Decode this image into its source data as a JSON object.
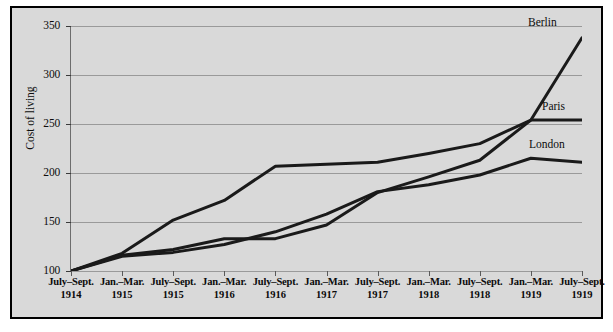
{
  "chart_data": {
    "type": "line",
    "title": "",
    "subtitle": "",
    "xlabel": "",
    "ylabel": "Cost of living",
    "ylim": [
      100,
      350
    ],
    "yticks": [
      100,
      150,
      200,
      250,
      300,
      350
    ],
    "grid": true,
    "legend_position": "inline-right-end-labels",
    "categories": [
      {
        "period": "July–Sept.",
        "year": "1914"
      },
      {
        "period": "Jan.–Mar.",
        "year": "1915"
      },
      {
        "period": "July–Sept.",
        "year": "1915"
      },
      {
        "period": "Jan.–Mar.",
        "year": "1916"
      },
      {
        "period": "July–Sept.",
        "year": "1916"
      },
      {
        "period": "Jan.–Mar.",
        "year": "1917"
      },
      {
        "period": "July–Sept.",
        "year": "1917"
      },
      {
        "period": "Jan.–Mar.",
        "year": "1918"
      },
      {
        "period": "July–Sept.",
        "year": "1918"
      },
      {
        "period": "Jan.–Mar.",
        "year": "1919"
      },
      {
        "period": "July–Sept.",
        "year": "1919"
      }
    ],
    "series": [
      {
        "name": "Berlin",
        "color": "#1a1a1a",
        "values": [
          100,
          118,
          152,
          172,
          207,
          209,
          211,
          220,
          230,
          254,
          338
        ]
      },
      {
        "name": "Paris",
        "color": "#1a1a1a",
        "values": [
          100,
          116,
          122,
          133,
          133,
          147,
          180,
          196,
          213,
          254,
          254
        ]
      },
      {
        "name": "London",
        "color": "#1a1a1a",
        "values": [
          100,
          115,
          119,
          127,
          140,
          158,
          181,
          188,
          198,
          215,
          211
        ]
      }
    ]
  },
  "axis": {
    "y_title": "Cost of living",
    "y_tick_labels": [
      "100",
      "150",
      "200",
      "250",
      "300",
      "350"
    ]
  },
  "series_labels": {
    "berlin": "Berlin",
    "paris": "Paris",
    "london": "London"
  },
  "colors": {
    "plot_background": "#d9d9d9",
    "frame_border": "#000000",
    "gridline": "#9a9a9a",
    "line": "#1a1a1a",
    "text": "#0b0b0b"
  }
}
